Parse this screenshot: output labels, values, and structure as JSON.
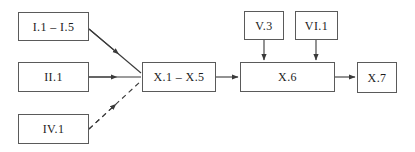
{
  "diagram": {
    "type": "flowchart",
    "title": "",
    "canvas": {
      "width": 415,
      "height": 152,
      "background": "#ffffff"
    },
    "style": {
      "box_border_color": "#5a5a5a",
      "box_fill": "#ffffff",
      "text_color": "#1c1c1c",
      "arrow_color": "#3a3a3a"
    },
    "nodes": [
      {
        "id": "n1",
        "label": "I.1 – I.5",
        "x": 18,
        "y": 12,
        "w": 71,
        "h": 29
      },
      {
        "id": "n2",
        "label": "II.1",
        "x": 18,
        "y": 62,
        "w": 71,
        "h": 30
      },
      {
        "id": "n3",
        "label": "IV.1",
        "x": 18,
        "y": 114,
        "w": 71,
        "h": 30
      },
      {
        "id": "n4",
        "label": "X.1 – X.5",
        "x": 142,
        "y": 62,
        "w": 74,
        "h": 30
      },
      {
        "id": "n5",
        "label": "V.3",
        "x": 244,
        "y": 11,
        "w": 40,
        "h": 29
      },
      {
        "id": "n6",
        "label": "VI.1",
        "x": 295,
        "y": 11,
        "w": 43,
        "h": 29
      },
      {
        "id": "n7",
        "label": "X.6",
        "x": 240,
        "y": 62,
        "w": 95,
        "h": 30
      },
      {
        "id": "n8",
        "label": "X.7",
        "x": 357,
        "y": 62,
        "w": 40,
        "h": 31
      }
    ],
    "edges": [
      {
        "id": "e1",
        "from": "n1",
        "to": "n4",
        "style": "solid",
        "label": ""
      },
      {
        "id": "e2",
        "from": "n2",
        "to": "n4",
        "style": "solid",
        "label": ""
      },
      {
        "id": "e3",
        "from": "n3",
        "to": "n4",
        "style": "dashed",
        "label": ""
      },
      {
        "id": "e4",
        "from": "n4",
        "to": "n7",
        "style": "solid",
        "label": ""
      },
      {
        "id": "e5",
        "from": "n5",
        "to": "n7",
        "style": "solid",
        "label": ""
      },
      {
        "id": "e6",
        "from": "n6",
        "to": "n7",
        "style": "solid",
        "label": ""
      },
      {
        "id": "e7",
        "from": "n7",
        "to": "n8",
        "style": "solid",
        "label": ""
      }
    ]
  }
}
